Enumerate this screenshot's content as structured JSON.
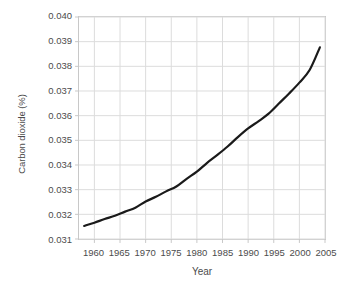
{
  "chart_data": {
    "type": "line",
    "title": "",
    "xlabel": "Year",
    "ylabel": "Carbon dioxide (%)",
    "xlim": [
      1957,
      2005
    ],
    "ylim": [
      0.031,
      0.04
    ],
    "grid": true,
    "legend": false,
    "line_color": "#1a1a1a",
    "grid_color": "#dcdcdc",
    "axis_color": "#c8c8c8",
    "xticks": [
      1960,
      1965,
      1970,
      1975,
      1980,
      1985,
      1990,
      1995,
      2000,
      2005
    ],
    "xtick_labels": [
      "1960",
      "1965",
      "1970",
      "1975",
      "1980",
      "1985",
      "1990",
      "1995",
      "2000",
      "2005"
    ],
    "yticks": [
      0.031,
      0.032,
      0.033,
      0.034,
      0.035,
      0.036,
      0.037,
      0.038,
      0.039,
      0.04
    ],
    "ytick_labels": [
      "0.031",
      "0.032",
      "0.033",
      "0.034",
      "0.035",
      "0.036",
      "0.037",
      "0.038",
      "0.039",
      "0.040"
    ],
    "series": [
      {
        "name": "Atmospheric carbon dioxide",
        "x": [
          1958,
          1960,
          1962,
          1964,
          1966,
          1968,
          1970,
          1972,
          1974,
          1976,
          1978,
          1980,
          1982,
          1984,
          1986,
          1988,
          1990,
          1992,
          1994,
          1996,
          1998,
          2000,
          2002,
          2004
        ],
        "y": [
          0.03153,
          0.03166,
          0.03181,
          0.03194,
          0.03211,
          0.03227,
          0.03252,
          0.03271,
          0.03293,
          0.03313,
          0.03344,
          0.03373,
          0.03409,
          0.03441,
          0.03475,
          0.03513,
          0.03548,
          0.03577,
          0.03608,
          0.03649,
          0.0369,
          0.03734,
          0.03785,
          0.03877
        ]
      }
    ]
  }
}
